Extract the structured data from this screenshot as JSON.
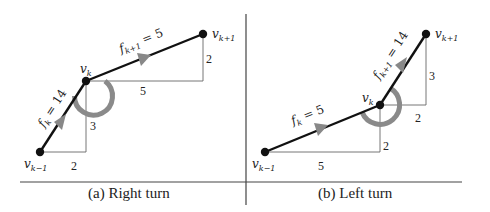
{
  "colors": {
    "edge": "#111111",
    "guide": "#555555",
    "arc": "#8a8a8a",
    "text": "#222222",
    "rule": "#444444"
  },
  "panels": [
    {
      "id": "a",
      "caption": "(a) Right turn",
      "vertices": {
        "prev": {
          "label": "v",
          "sub": "k−1"
        },
        "cur": {
          "label": "v",
          "sub": "k"
        },
        "next": {
          "label": "v",
          "sub": "k+1"
        }
      },
      "edges": [
        {
          "label": "f",
          "sub": "k",
          "value": " = 14"
        },
        {
          "label": "f",
          "sub": "k+1",
          "value": " = 5"
        }
      ],
      "dimensions": {
        "dx1": "2",
        "dy1": "3",
        "dx2": "5",
        "dy2": "2"
      }
    },
    {
      "id": "b",
      "caption": "(b) Left turn",
      "vertices": {
        "prev": {
          "label": "v",
          "sub": "k−1"
        },
        "cur": {
          "label": "v",
          "sub": "k"
        },
        "next": {
          "label": "v",
          "sub": "k+1"
        }
      },
      "edges": [
        {
          "label": "f",
          "sub": "k",
          "value": " = 5"
        },
        {
          "label": "f",
          "sub": "k+1",
          "value": " = 14"
        }
      ],
      "dimensions": {
        "dx1": "5",
        "dy1": "2",
        "dx2": "2",
        "dy2": "3"
      }
    }
  ]
}
